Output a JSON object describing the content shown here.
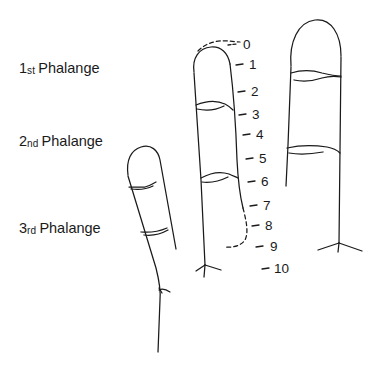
{
  "figure": {
    "background_color": "#ffffff",
    "ink_color": "#1a1a1a",
    "width": 378,
    "height": 370
  },
  "labels": {
    "phalanges": [
      {
        "number": "1",
        "ordinal": "st",
        "word": "Phalange",
        "x": 19,
        "y": 61
      },
      {
        "number": "2",
        "ordinal": "nd",
        "word": "Phalange",
        "x": 19,
        "y": 134
      },
      {
        "number": "3",
        "ordinal": "rd",
        "word": "Phalange",
        "x": 19,
        "y": 221
      }
    ]
  },
  "chart_data": {
    "type": "scatter",
    "xlabel": "",
    "ylabel": "Scale position",
    "grid": false,
    "legend_position": "none",
    "axis_orientation": "vertical-descending",
    "ylim": [
      0,
      10
    ],
    "categories": [
      "0",
      "1",
      "2",
      "3",
      "4",
      "5",
      "6",
      "7",
      "8",
      "9",
      "10"
    ],
    "values": [
      0,
      1,
      2,
      3,
      4,
      5,
      6,
      7,
      8,
      9,
      10
    ],
    "tick_labels": [
      {
        "text": "0",
        "value": 0,
        "x": 243,
        "y": 38,
        "dash_x1": 228,
        "dash_x2": 237,
        "dash_y": 45,
        "dashed_leader": true
      },
      {
        "text": "1",
        "value": 1,
        "x": 249,
        "y": 58,
        "dash_x1": 236,
        "dash_x2": 243,
        "dash_y": 65,
        "dashed_leader": false
      },
      {
        "text": "2",
        "value": 2,
        "x": 251,
        "y": 85,
        "dash_x1": 238,
        "dash_x2": 245,
        "dash_y": 92,
        "dashed_leader": false
      },
      {
        "text": "3",
        "value": 3,
        "x": 252,
        "y": 108,
        "dash_x1": 239,
        "dash_x2": 246,
        "dash_y": 115,
        "dashed_leader": false
      },
      {
        "text": "4",
        "value": 4,
        "x": 256,
        "y": 128,
        "dash_x1": 243,
        "dash_x2": 250,
        "dash_y": 135,
        "dashed_leader": false
      },
      {
        "text": "5",
        "value": 5,
        "x": 259,
        "y": 152,
        "dash_x1": 246,
        "dash_x2": 253,
        "dash_y": 159,
        "dashed_leader": false
      },
      {
        "text": "6",
        "value": 6,
        "x": 261,
        "y": 175,
        "dash_x1": 248,
        "dash_x2": 255,
        "dash_y": 182,
        "dashed_leader": false
      },
      {
        "text": "7",
        "value": 7,
        "x": 263,
        "y": 199,
        "dash_x1": 250,
        "dash_x2": 257,
        "dash_y": 206,
        "dashed_leader": false
      },
      {
        "text": "8",
        "value": 8,
        "x": 265,
        "y": 219,
        "dash_x1": 252,
        "dash_x2": 259,
        "dash_y": 226,
        "dashed_leader": false
      },
      {
        "text": "9",
        "value": 9,
        "x": 270,
        "y": 240,
        "dash_x1": 256,
        "dash_x2": 263,
        "dash_y": 247,
        "dashed_leader": false
      },
      {
        "text": "10",
        "value": 10,
        "x": 274,
        "y": 262,
        "dash_x1": 262,
        "dash_x2": 269,
        "dash_y": 269,
        "dashed_leader": false
      }
    ],
    "annotations": [
      "1st Phalange",
      "2nd Phalange",
      "3rd Phalange"
    ],
    "series": [
      {
        "name": "left finger",
        "description": "Tilted finger, two creases, extends past bottom edge",
        "creases": 2
      },
      {
        "name": "middle finger",
        "description": "Tall finger aligned to the 0-10 scale, dashed tip leader and dashed lower-right edge",
        "creases": 2
      },
      {
        "name": "right finger",
        "description": "Upright finger with two creases and a webbed base",
        "creases": 2
      }
    ]
  }
}
